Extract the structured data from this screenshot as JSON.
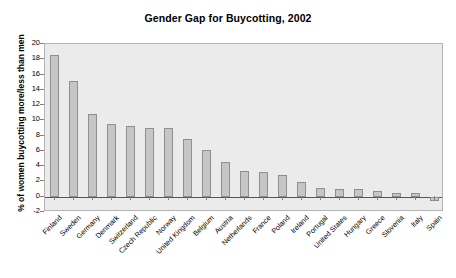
{
  "chart_data": {
    "type": "bar",
    "title": "Gender Gap for Buycotting, 2002",
    "xlabel": "",
    "ylabel": "% of women buycotting more/less than men",
    "ylim": [
      -2,
      20
    ],
    "ytick_step": 2,
    "yticks": [
      "20",
      "18",
      "16",
      "14",
      "12",
      "10",
      "8",
      "6",
      "4",
      "2",
      "0",
      "-2"
    ],
    "grid": false,
    "legend": null,
    "orientation": "vertical",
    "bar_color": "#c6c6c6",
    "bar_border_color": "#8f8f8f",
    "plot_background": "#ebebeb",
    "categories": [
      "Finland",
      "Sweden",
      "Germany",
      "Denmark",
      "Switzerland",
      "Czech Republic",
      "Norway",
      "United Kingdom",
      "Belgium",
      "Austria",
      "Netherlands",
      "France",
      "Poland",
      "Ireland",
      "Portugal",
      "United States",
      "Hungary",
      "Greece",
      "Slovenia",
      "Italy",
      "Spain"
    ],
    "values": [
      18.6,
      15.1,
      10.8,
      9.5,
      9.3,
      9.0,
      9.0,
      7.5,
      6.1,
      4.6,
      3.4,
      3.3,
      2.9,
      1.9,
      1.1,
      1.0,
      0.95,
      0.75,
      0.55,
      0.45,
      -0.6
    ]
  }
}
